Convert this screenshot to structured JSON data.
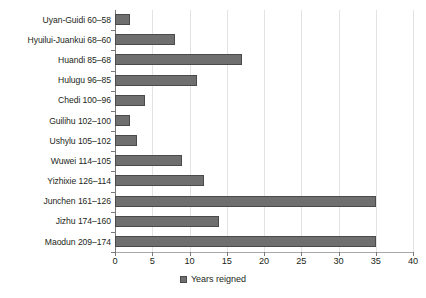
{
  "chart_data": {
    "type": "bar",
    "orientation": "horizontal",
    "title": "",
    "subtitle": "",
    "xlabel": "",
    "ylabel": "",
    "xlim": [
      0,
      40
    ],
    "xticks": [
      0,
      5,
      10,
      15,
      20,
      25,
      30,
      35,
      40
    ],
    "grid": "vertical",
    "legend_position": "bottom-center",
    "legend": [
      "Years reigned"
    ],
    "series_name": "Years reigned",
    "categories": [
      "Uyan-Guidi 60–58",
      "Hyuilui-Juankui 68–60",
      "Huandi 85–68",
      "Hulugu 96–85",
      "Chedi 100–96",
      "Guilihu 102–100",
      "Ushylu 105–102",
      "Wuwei 114–105",
      "Yizhixie 126–114",
      "Junchen 161–126",
      "Jizhu 174–160",
      "Maodun 209–174"
    ],
    "values": [
      2,
      8,
      17,
      11,
      4,
      2,
      3,
      9,
      12,
      35,
      14,
      35
    ],
    "colors": {
      "bar_fill": "#6f6f6f",
      "bar_stroke": "#4a4a4a",
      "gridline": "#e3e3e3",
      "axis": "#7a7a7a",
      "text": "#231f20",
      "background": "#ffffff"
    }
  },
  "legend": {
    "swatch_name": "legend-swatch-years-reigned",
    "label": "Years reigned"
  }
}
